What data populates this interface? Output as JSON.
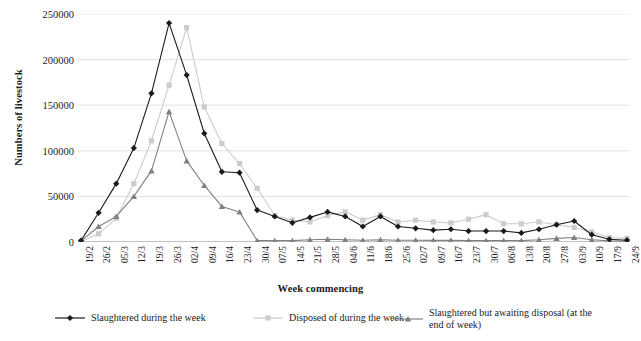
{
  "chart_data": {
    "type": "line",
    "title": "",
    "xlabel": "Week commencing",
    "ylabel": "Numbers of livestock",
    "ylim": [
      0,
      250000
    ],
    "yticks": [
      0,
      50000,
      100000,
      150000,
      200000,
      250000
    ],
    "ytick_labels": [
      "0",
      "50000",
      "100000",
      "150000",
      "200000",
      "250000"
    ],
    "grid": "horizontal",
    "legend_position": "bottom",
    "categories": [
      "19/2",
      "26/2",
      "05/3",
      "12/3",
      "19/3",
      "26/3",
      "02/4",
      "09/4",
      "16/4",
      "23/4",
      "30/4",
      "07/5",
      "14/5",
      "21/5",
      "28/5",
      "04/6",
      "11/6",
      "18/6",
      "25/6",
      "02/7",
      "09/7",
      "16/7",
      "23/7",
      "30/7",
      "06/8",
      "13/8",
      "20/8",
      "27/8",
      "03/9",
      "10/9",
      "17/9",
      "24/9"
    ],
    "series": [
      {
        "name": "Slaughtered during the week",
        "color": "#1a1a1a",
        "marker": "diamond",
        "values": [
          1500,
          32000,
          64000,
          103000,
          163000,
          240000,
          183000,
          119000,
          77000,
          76000,
          35000,
          28000,
          21000,
          27000,
          33000,
          28000,
          17000,
          28000,
          17000,
          15000,
          13000,
          14000,
          12000,
          12000,
          12000,
          10000,
          14000,
          19000,
          23000,
          8000,
          3000,
          2000
        ]
      },
      {
        "name": "Disposed of during the week",
        "color": "#cccccc",
        "marker": "square",
        "values": [
          500,
          9000,
          26000,
          64000,
          111000,
          172000,
          235000,
          148000,
          108000,
          86000,
          59000,
          29000,
          24000,
          22000,
          29000,
          33000,
          24000,
          30000,
          22000,
          24000,
          22000,
          21000,
          25000,
          30000,
          20000,
          20000,
          22000,
          19000,
          16000,
          11000,
          5000,
          4000
        ]
      },
      {
        "name": "Slaughtered but awaiting disposal (at the end of week)",
        "color": "#808080",
        "marker": "triangle",
        "values": [
          1000,
          17000,
          28000,
          50000,
          78000,
          143000,
          89000,
          62000,
          39000,
          33000,
          1500,
          1500,
          1500,
          2500,
          3000,
          2500,
          2000,
          2500,
          2000,
          2000,
          1800,
          1800,
          1500,
          1500,
          1500,
          1500,
          2500,
          4000,
          5000,
          2500,
          1200,
          800
        ]
      }
    ]
  }
}
